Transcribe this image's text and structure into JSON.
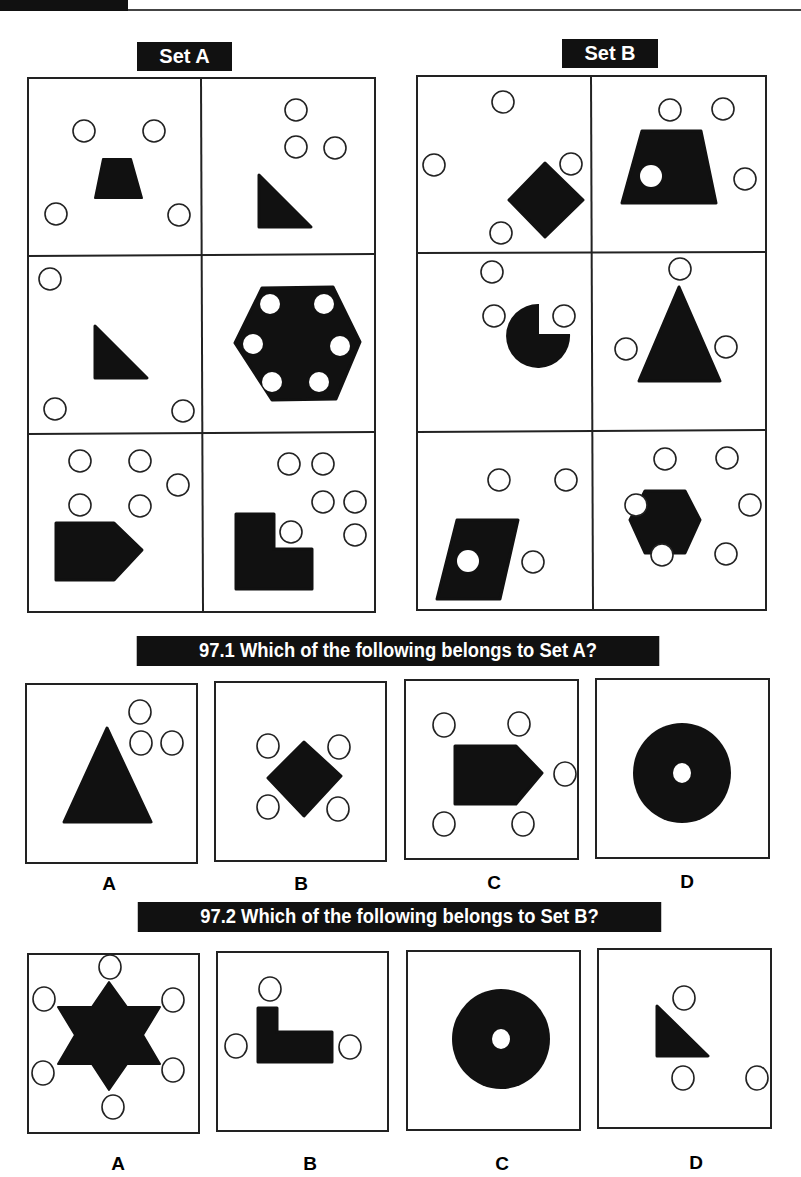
{
  "page": {
    "set_a": {
      "label": "Set A",
      "cells": [
        {
          "figure": "trapezoid",
          "outer_circles": 4,
          "inner_circles": 0
        },
        {
          "figure": "right-triangle",
          "outer_circles": 3,
          "inner_circles": 0
        },
        {
          "figure": "right-triangle",
          "outer_circles": 3,
          "inner_circles": 0
        },
        {
          "figure": "hexagon",
          "outer_circles": 0,
          "inner_circles": 6
        },
        {
          "figure": "pentagon-arrow",
          "outer_circles": 5,
          "inner_circles": 0
        },
        {
          "figure": "l-shape",
          "outer_circles": 6,
          "inner_circles": 0
        }
      ]
    },
    "set_b": {
      "label": "Set B",
      "cells": [
        {
          "figure": "diamond",
          "outer_circles": 4,
          "inner_circles": 0
        },
        {
          "figure": "trapezoid",
          "outer_circles": 3,
          "inner_circles": 1
        },
        {
          "figure": "pac-man-circle",
          "outer_circles": 3,
          "inner_circles": 0
        },
        {
          "figure": "triangle",
          "outer_circles": 3,
          "inner_circles": 0
        },
        {
          "figure": "parallelogram",
          "outer_circles": 3,
          "inner_circles": 1
        },
        {
          "figure": "hexagon",
          "outer_circles": 6,
          "inner_circles": 0
        }
      ]
    },
    "q1": {
      "title": "97.1 Which of the following belongs to Set A?",
      "options": [
        {
          "letter": "A",
          "figure": "triangle",
          "outer_circles": 3
        },
        {
          "letter": "B",
          "figure": "diamond",
          "outer_circles": 4
        },
        {
          "letter": "C",
          "figure": "pentagon-arrow",
          "outer_circles": 5
        },
        {
          "letter": "D",
          "figure": "ring",
          "outer_circles": 0,
          "inner_circles": 1
        }
      ]
    },
    "q2": {
      "title": "97.2 Which of the following belongs to Set B?",
      "options": [
        {
          "letter": "A",
          "figure": "star-of-david",
          "outer_circles": 6
        },
        {
          "letter": "B",
          "figure": "l-shape",
          "outer_circles": 3
        },
        {
          "letter": "C",
          "figure": "ring",
          "outer_circles": 0,
          "inner_circles": 1
        },
        {
          "letter": "D",
          "figure": "right-triangle",
          "outer_circles": 3
        }
      ]
    }
  }
}
